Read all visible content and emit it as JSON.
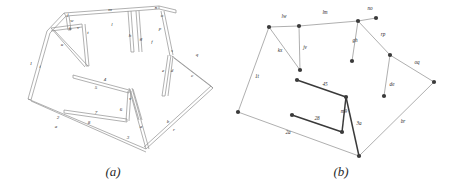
{
  "figure": {
    "background": "#ffffff",
    "line_color": "#8a8a8a",
    "node_color": "#3a3a3a",
    "label_color": "#2a2a2a"
  },
  "panels": [
    {
      "id": "a",
      "caption": "(a)",
      "description": "3D wireframe truss structure rendered as thin double-line beams with labelled members",
      "labels": [
        {
          "id": "a-j",
          "text": "j",
          "x": 68,
          "y": 16
        },
        {
          "id": "a-m",
          "text": "m",
          "x": 110,
          "y": 11
        },
        {
          "id": "a-n",
          "text": "n",
          "x": 156,
          "y": 9
        },
        {
          "id": "a-o",
          "text": "o",
          "x": 162,
          "y": 17
        },
        {
          "id": "a-l",
          "text": "l",
          "x": 112,
          "y": 26
        },
        {
          "id": "a-w",
          "text": "w",
          "x": 72,
          "y": 22
        },
        {
          "id": "a-k",
          "text": "k",
          "x": 70,
          "y": 30
        },
        {
          "id": "a-v",
          "text": "v",
          "x": 78,
          "y": 29
        },
        {
          "id": "a-u",
          "text": "u",
          "x": 62,
          "y": 46
        },
        {
          "id": "a-t",
          "text": "t",
          "x": 88,
          "y": 34
        },
        {
          "id": "a-h",
          "text": "h",
          "x": 130,
          "y": 37
        },
        {
          "id": "a-g",
          "text": "g",
          "x": 141,
          "y": 40
        },
        {
          "id": "a-p",
          "text": "p",
          "x": 160,
          "y": 30
        },
        {
          "id": "a-f",
          "text": "f",
          "x": 152,
          "y": 43
        },
        {
          "id": "a-s",
          "text": "s",
          "x": 172,
          "y": 52
        },
        {
          "id": "a-e",
          "text": "e",
          "x": 163,
          "y": 72
        },
        {
          "id": "a-d",
          "text": "d",
          "x": 172,
          "y": 72
        },
        {
          "id": "a-q",
          "text": "q",
          "x": 197,
          "y": 56
        },
        {
          "id": "a-c",
          "text": "c",
          "x": 192,
          "y": 77
        },
        {
          "id": "a-1",
          "text": "1",
          "x": 31,
          "y": 65
        },
        {
          "id": "a-i",
          "text": "i",
          "x": 40,
          "y": 68
        },
        {
          "id": "a-4",
          "text": "4",
          "x": 105,
          "y": 81
        },
        {
          "id": "a-5",
          "text": "5",
          "x": 96,
          "y": 89
        },
        {
          "id": "a-7",
          "text": "7",
          "x": 96,
          "y": 114
        },
        {
          "id": "a-8",
          "text": "8",
          "x": 89,
          "y": 124
        },
        {
          "id": "a-6",
          "text": "6",
          "x": 121,
          "y": 111
        },
        {
          "id": "a-v2",
          "text": "v",
          "x": 130,
          "y": 100
        },
        {
          "id": "a-2",
          "text": "2",
          "x": 58,
          "y": 119
        },
        {
          "id": "a-a2",
          "text": "a",
          "x": 56,
          "y": 128
        },
        {
          "id": "a-3",
          "text": "3",
          "x": 128,
          "y": 139
        },
        {
          "id": "a-a",
          "text": "a",
          "x": 141,
          "y": 128
        },
        {
          "id": "a-b",
          "text": "b",
          "x": 168,
          "y": 123
        },
        {
          "id": "a-r",
          "text": "r",
          "x": 174,
          "y": 131
        }
      ]
    },
    {
      "id": "b",
      "caption": "(b)",
      "description": "Simplified skeleton graph of the same structure with two-character edge labels",
      "labels": [
        {
          "id": "b-lw",
          "text": "lw",
          "x": 56,
          "y": 18
        },
        {
          "id": "b-lm",
          "text": "lm",
          "x": 97,
          "y": 14
        },
        {
          "id": "b-no",
          "text": "no",
          "x": 142,
          "y": 10
        },
        {
          "id": "b-gh",
          "text": "gh",
          "x": 127,
          "y": 42
        },
        {
          "id": "b-rp",
          "text": "rp",
          "x": 155,
          "y": 36
        },
        {
          "id": "b-oq",
          "text": "oq",
          "x": 189,
          "y": 64
        },
        {
          "id": "b-kx",
          "text": "kx",
          "x": 52,
          "y": 52
        },
        {
          "id": "b-jv",
          "text": "jv",
          "x": 77,
          "y": 49
        },
        {
          "id": "b-1t",
          "text": "1t",
          "x": 29,
          "y": 78
        },
        {
          "id": "b-de",
          "text": "de",
          "x": 164,
          "y": 86
        },
        {
          "id": "b-45",
          "text": "45",
          "x": 97,
          "y": 86
        },
        {
          "id": "b-m9",
          "text": "m9",
          "x": 116,
          "y": 113
        },
        {
          "id": "b-28",
          "text": "28",
          "x": 89,
          "y": 120
        },
        {
          "id": "b-3a",
          "text": "3a",
          "x": 131,
          "y": 125
        },
        {
          "id": "b-2a",
          "text": "2a",
          "x": 60,
          "y": 134
        },
        {
          "id": "b-br",
          "text": "br",
          "x": 175,
          "y": 123
        }
      ],
      "nodes": [
        {
          "id": "b-node-1",
          "x": 41,
          "y": 27
        },
        {
          "id": "b-node-2",
          "x": 71,
          "y": 26
        },
        {
          "id": "b-node-3",
          "x": 130,
          "y": 21
        },
        {
          "id": "b-node-4",
          "x": 148,
          "y": 18
        },
        {
          "id": "b-node-5",
          "x": 72,
          "y": 70
        },
        {
          "id": "b-node-6",
          "x": 124,
          "y": 61
        },
        {
          "id": "b-node-7",
          "x": 162,
          "y": 55
        },
        {
          "id": "b-node-8",
          "x": 156,
          "y": 96
        },
        {
          "id": "b-node-9",
          "x": 206,
          "y": 82
        },
        {
          "id": "b-node-10",
          "x": 69,
          "y": 80
        },
        {
          "id": "b-node-11",
          "x": 118,
          "y": 97
        },
        {
          "id": "b-node-12",
          "x": 64,
          "y": 115
        },
        {
          "id": "b-node-13",
          "x": 114,
          "y": 132
        },
        {
          "id": "b-node-14",
          "x": 10,
          "y": 112
        },
        {
          "id": "b-node-15",
          "x": 131,
          "y": 156
        }
      ]
    }
  ]
}
